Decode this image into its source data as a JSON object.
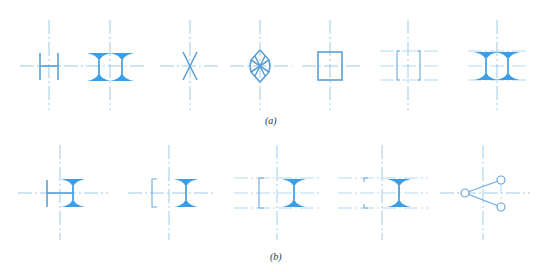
{
  "figure": {
    "panels": [
      {
        "id": "a",
        "caption": "(a)",
        "symbols": [
          {
            "name": "double-bar-h-symbol"
          },
          {
            "name": "double-i-beam-symbol"
          },
          {
            "name": "x-cross-symbol"
          },
          {
            "name": "diamond-lattice-symbol"
          },
          {
            "name": "square-box-symbol"
          },
          {
            "name": "bracket-box-symbol"
          },
          {
            "name": "double-i-beam-with-guides-symbol"
          }
        ]
      },
      {
        "id": "b",
        "caption": "(b)",
        "symbols": [
          {
            "name": "bar-plus-i-beam-symbol"
          },
          {
            "name": "bracket-plus-i-beam-symbol"
          },
          {
            "name": "bracket-plus-i-beam-with-guides-symbol"
          },
          {
            "name": "corner-marks-plus-i-beam-symbol"
          },
          {
            "name": "three-node-link-symbol"
          }
        ]
      }
    ],
    "colors": {
      "symbol_fill": "#3d9ee8",
      "symbol_stroke": "#5a9fd6",
      "centerline": "#9fcbe8"
    }
  }
}
